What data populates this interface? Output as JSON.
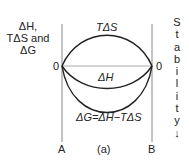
{
  "diagram": {
    "y_axis_label_lines": [
      "ΔH,",
      "TΔS and",
      "ΔG"
    ],
    "zero_left": "0",
    "zero_right": "0",
    "curves": {
      "tds": {
        "label": "TΔS",
        "shape": "positive arc above zero line"
      },
      "dh": {
        "label": "ΔH",
        "shape": "shallow negative arc below zero line"
      },
      "dg": {
        "label": "ΔG=ΔH−TΔS",
        "shape": "deep negative arc below zero line"
      }
    },
    "left_endpoint": "A",
    "right_endpoint": "B",
    "panel_label": "(a)",
    "stability_letters": [
      "S",
      "t",
      "a",
      "b",
      "i",
      "l",
      "i",
      "t",
      "y",
      "↓"
    ],
    "colors": {
      "line": "#222222",
      "axis": "#888888",
      "zero_line": "#aaaaaa"
    }
  }
}
